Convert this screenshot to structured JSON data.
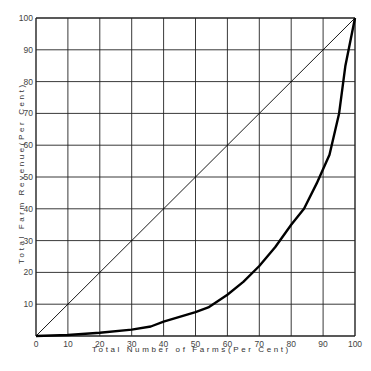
{
  "chart_data": {
    "type": "line",
    "title": "",
    "xlabel": "Total Number of Farms(Per Cent)",
    "ylabel": "Total Farm Revenue(Per Cent)",
    "xlim": [
      0,
      100
    ],
    "ylim": [
      0,
      100
    ],
    "grid": true,
    "legend": null,
    "x_ticks": [
      "0",
      "10",
      "20",
      "30",
      "40",
      "50",
      "60",
      "70",
      "80",
      "90",
      "100"
    ],
    "y_ticks": [
      "10",
      "20",
      "30",
      "40",
      "50",
      "60",
      "70",
      "80",
      "90",
      "100"
    ],
    "series": [
      {
        "name": "Line of equality",
        "style": "thin",
        "x": [
          0,
          100
        ],
        "y": [
          0,
          100
        ]
      },
      {
        "name": "Lorenz curve",
        "style": "thick",
        "x": [
          0,
          10,
          20,
          30,
          36,
          40,
          50,
          54,
          60,
          65,
          70,
          75,
          80,
          84,
          88,
          92,
          95,
          97,
          100
        ],
        "y": [
          0,
          0.3,
          1,
          2,
          3,
          4.5,
          7.5,
          9,
          13,
          17,
          22,
          28,
          35,
          40,
          48,
          57,
          70,
          85,
          100
        ]
      }
    ]
  },
  "colors": {
    "grid": "#222222",
    "curve": "#000000",
    "text": "#444444"
  }
}
